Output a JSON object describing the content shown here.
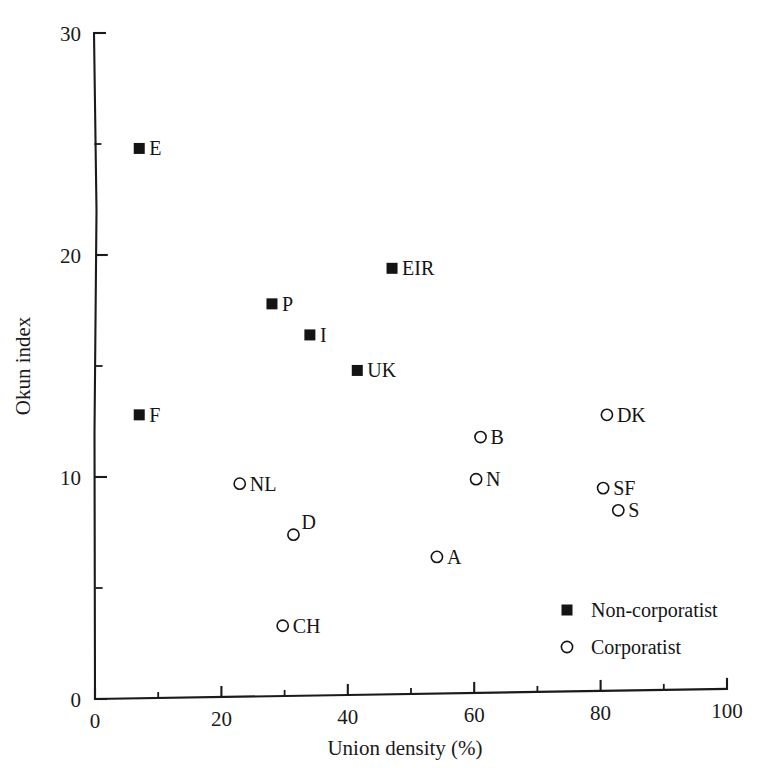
{
  "chart_data": {
    "type": "scatter",
    "title": "",
    "xlabel": "Union density (%)",
    "ylabel": "Okun index",
    "xlim": [
      0,
      100
    ],
    "ylim": [
      0,
      30
    ],
    "xticks": [
      0,
      20,
      40,
      60,
      80,
      100
    ],
    "xticklabels": [
      "0",
      "20",
      "40",
      "60",
      "80",
      "100"
    ],
    "xminorticks": [
      10,
      30,
      50,
      70,
      90
    ],
    "yticks": [
      0,
      10,
      20,
      30
    ],
    "yticklabels": [
      "0",
      "10",
      "20",
      "30"
    ],
    "yminorticks": [
      5,
      15,
      25
    ],
    "grid": false,
    "legend_position": "lower-right",
    "series": [
      {
        "name": "Non-corporatist",
        "marker": "filled-square",
        "points": [
          {
            "label": "E",
            "x": 7,
            "y": 24.8,
            "label_dx": 10,
            "label_dy": 7
          },
          {
            "label": "EIR",
            "x": 47,
            "y": 19.4,
            "label_dx": 10,
            "label_dy": 7
          },
          {
            "label": "P",
            "x": 28,
            "y": 17.8,
            "label_dx": 10,
            "label_dy": 7
          },
          {
            "label": "I",
            "x": 34,
            "y": 16.4,
            "label_dx": 10,
            "label_dy": 7
          },
          {
            "label": "UK",
            "x": 41.5,
            "y": 14.8,
            "label_dx": 10,
            "label_dy": 7
          },
          {
            "label": "F",
            "x": 7,
            "y": 12.8,
            "label_dx": 10,
            "label_dy": 7
          }
        ]
      },
      {
        "name": "Corporatist",
        "marker": "open-circle",
        "points": [
          {
            "label": "DK",
            "x": 81,
            "y": 12.8,
            "label_dx": 10,
            "label_dy": 7
          },
          {
            "label": "B",
            "x": 61,
            "y": 11.8,
            "label_dx": 10,
            "label_dy": 7
          },
          {
            "label": "NL",
            "x": 22.9,
            "y": 9.7,
            "label_dx": 10,
            "label_dy": 7
          },
          {
            "label": "N",
            "x": 60.3,
            "y": 9.9,
            "label_dx": 10,
            "label_dy": 7
          },
          {
            "label": "SF",
            "x": 80.4,
            "y": 9.5,
            "label_dx": 10,
            "label_dy": 7
          },
          {
            "label": "S",
            "x": 82.8,
            "y": 8.5,
            "label_dx": 10,
            "label_dy": 7
          },
          {
            "label": "D",
            "x": 31.4,
            "y": 7.4,
            "label_dx": 8,
            "label_dy": -6
          },
          {
            "label": "A",
            "x": 54.1,
            "y": 6.4,
            "label_dx": 10,
            "label_dy": 7
          },
          {
            "label": "CH",
            "x": 29.7,
            "y": 3.3,
            "label_dx": 10,
            "label_dy": 7
          }
        ]
      }
    ],
    "legend": [
      {
        "label": "Non-corporatist",
        "marker": "filled-square"
      },
      {
        "label": "Corporatist",
        "marker": "open-circle"
      }
    ],
    "colors": {
      "marker": "#141414",
      "axis": "#1a1a1a",
      "background": "#ffffff"
    }
  }
}
